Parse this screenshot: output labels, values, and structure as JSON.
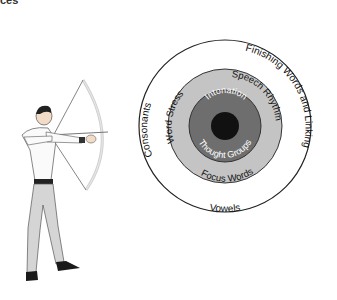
{
  "header": {
    "fragment": "ces"
  },
  "diagram": {
    "rings": {
      "outer": {
        "top": "Finishing Words and Linking",
        "left": "Consonants",
        "bottom": "Vowels",
        "fill": "#ffffff"
      },
      "middle": {
        "top_left": "Word Stress",
        "top_right": "Speech Rhythm",
        "bottom": "Focus Words",
        "fill": "#c4c4c4"
      },
      "inner": {
        "top": "Intonation",
        "bottom": "Thought Groups",
        "fill": "#6e6e6e"
      },
      "bullseye": {
        "fill": "#111111"
      }
    },
    "figure": "archer-icon"
  }
}
